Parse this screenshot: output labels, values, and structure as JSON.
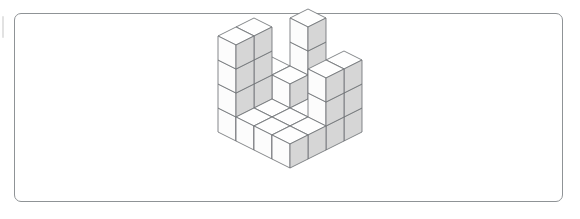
{
  "figure": {
    "kind": "isometric-cube-stack",
    "total_cubes": 36
  },
  "frame": {
    "border_color": "#8f9396",
    "fill_color": "#ffffff",
    "corner_radius_px": 7,
    "x": 14,
    "y": 13,
    "width": 549,
    "height": 189
  },
  "edge_mark": {
    "color": "#e2e2e2",
    "x": 2,
    "y": 16,
    "width": 2,
    "height": 22
  },
  "palette": {
    "top_face": "#fefefe",
    "left_face": "#fcfcfc",
    "right_face": "#d6d6d6",
    "edge_stroke": "#6f7276",
    "background": "#ffffff"
  },
  "projection": {
    "tile_half_width": 18,
    "tile_half_height": 9,
    "cube_height": 24,
    "origin_x": 290,
    "origin_y": 72,
    "rows": 4,
    "cols": 4,
    "note": "row index increases toward lower-left, col index increases toward lower-right"
  },
  "chart_data": {
    "type": "heatmap",
    "xlabel": "column (toward front-right)",
    "ylabel": "row (toward front-left)",
    "categories_x": [
      "c0",
      "c1",
      "c2",
      "c3"
    ],
    "categories_y": [
      "r0",
      "r1",
      "r2",
      "r3"
    ],
    "values": [
      [
        1,
        4,
        1,
        3
      ],
      [
        2,
        2,
        1,
        3
      ],
      [
        4,
        1,
        1,
        1
      ],
      [
        4,
        1,
        1,
        1
      ]
    ],
    "zlim": [
      0,
      4
    ],
    "grid": false,
    "legend": "none"
  }
}
